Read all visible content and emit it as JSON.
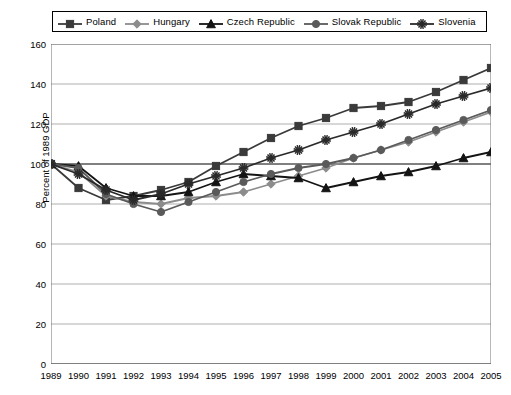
{
  "legend": {
    "position": "top",
    "entries": [
      {
        "label": "Poland",
        "marker": "square",
        "color": "#3a3a3a"
      },
      {
        "label": "Hungary",
        "marker": "diamond",
        "color": "#8c8c8c"
      },
      {
        "label": "Czech Republic",
        "marker": "triangle",
        "color": "#141414"
      },
      {
        "label": "Slovak Republic",
        "marker": "circle",
        "color": "#5a5a5a"
      },
      {
        "label": "Slovenia",
        "marker": "star",
        "color": "#2a2a2a"
      }
    ]
  },
  "axes": {
    "ylabel": "Percent of 1989 GDP",
    "xlabel": "",
    "yticks": [
      0,
      20,
      40,
      60,
      80,
      100,
      120,
      140,
      160
    ],
    "xticks": [
      "1989",
      "1990",
      "1991",
      "1992",
      "1993",
      "1994",
      "1995",
      "1996",
      "1997",
      "1998",
      "1999",
      "2000",
      "2001",
      "2002",
      "2003",
      "2004",
      "2005"
    ],
    "ylim": [
      0,
      160
    ],
    "grid": "horizontal"
  },
  "chart_data": {
    "type": "line",
    "title": "",
    "xlabel": "",
    "ylabel": "Percent of 1989 GDP",
    "ylim": [
      0,
      160
    ],
    "grid": true,
    "legend_position": "top",
    "x": [
      "1989",
      "1990",
      "1991",
      "1992",
      "1993",
      "1994",
      "1995",
      "1996",
      "1997",
      "1998",
      "1999",
      "2000",
      "2001",
      "2002",
      "2003",
      "2004",
      "2005"
    ],
    "series": [
      {
        "name": "Poland",
        "marker": "square",
        "color": "#3a3a3a",
        "values": [
          100,
          88,
          82,
          84,
          87,
          91,
          99,
          106,
          113,
          119,
          123,
          128,
          129,
          131,
          136,
          142,
          148
        ]
      },
      {
        "name": "Hungary",
        "marker": "diamond",
        "color": "#8c8c8c",
        "values": [
          100,
          96,
          84,
          81,
          80,
          83,
          84,
          86,
          90,
          94,
          98,
          103,
          107,
          111,
          116,
          121,
          126
        ]
      },
      {
        "name": "Czech Republic",
        "marker": "triangle",
        "color": "#141414",
        "values": [
          100,
          99,
          88,
          84,
          84,
          86,
          91,
          95,
          94,
          93,
          88,
          91,
          94,
          96,
          99,
          103,
          106
        ]
      },
      {
        "name": "Slovak Republic",
        "marker": "circle",
        "color": "#5a5a5a",
        "values": [
          100,
          98,
          85,
          80,
          76,
          81,
          86,
          91,
          95,
          98,
          100,
          103,
          107,
          112,
          117,
          122,
          127
        ]
      },
      {
        "name": "Slovenia",
        "marker": "star",
        "color": "#2a2a2a",
        "values": [
          100,
          95,
          87,
          82,
          85,
          90,
          94,
          98,
          103,
          107,
          112,
          116,
          120,
          125,
          130,
          134,
          138
        ]
      }
    ]
  }
}
